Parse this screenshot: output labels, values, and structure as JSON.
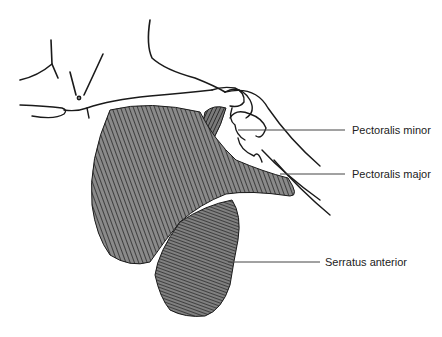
{
  "figure": {
    "labels": [
      {
        "id": "pectoralis-minor",
        "text": "Pectoralis minor",
        "x": 352,
        "y": 124,
        "line_from_x": 238,
        "line_y": 130
      },
      {
        "id": "pectoralis-major",
        "text": "Pectoralis major",
        "x": 352,
        "y": 168,
        "line_from_x": 280,
        "line_y": 174
      },
      {
        "id": "serratus-anterior",
        "text": "Serratus anterior",
        "x": 325,
        "y": 256,
        "line_from_x": 228,
        "line_y": 262
      }
    ],
    "colors": {
      "outline": "#1a1a1a",
      "muscle_fill": "#8a8a8a",
      "muscle_fiber": "#2a2a2a",
      "leader_line": "#444444",
      "text": "#222222"
    }
  }
}
